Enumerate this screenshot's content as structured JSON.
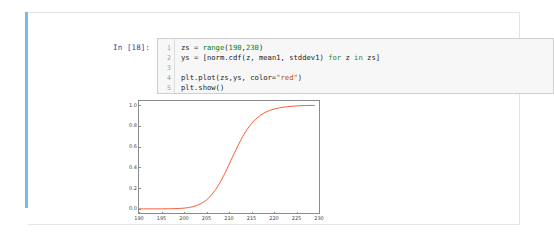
{
  "notebook": {
    "cell": {
      "prompt_label": "In [18]:",
      "line_numbers": [
        "1",
        "2",
        "3",
        "4",
        "5"
      ],
      "code_lines": [
        {
          "number": "1",
          "segments": [
            {
              "text": "zs ",
              "type": "plain"
            },
            {
              "text": "= ",
              "type": "op"
            },
            {
              "text": "range",
              "type": "fn"
            },
            {
              "text": "(",
              "type": "plain"
            },
            {
              "text": "190",
              "type": "num"
            },
            {
              "text": ",",
              "type": "plain"
            },
            {
              "text": "230",
              "type": "num"
            },
            {
              "text": ")",
              "type": "plain"
            }
          ]
        },
        {
          "number": "2",
          "segments": [
            {
              "text": "ys ",
              "type": "plain"
            },
            {
              "text": "= ",
              "type": "op"
            },
            {
              "text": "[norm.cdf(z, mean1, stddev1) ",
              "type": "plain"
            },
            {
              "text": "for ",
              "type": "kw"
            },
            {
              "text": "z ",
              "type": "plain"
            },
            {
              "text": "in ",
              "type": "kw"
            },
            {
              "text": "zs]",
              "type": "plain"
            }
          ]
        },
        {
          "number": "3",
          "segments": []
        },
        {
          "number": "4",
          "segments": [
            {
              "text": "plt.plot(zs,ys, color=",
              "type": "plain"
            },
            {
              "text": "\"red\"",
              "type": "str"
            },
            {
              "text": ")",
              "type": "plain"
            }
          ]
        },
        {
          "number": "5",
          "segments": [
            {
              "text": "plt.show()",
              "type": "plain"
            }
          ]
        }
      ],
      "code_text": "zs = range(190,230)\nys = [norm.cdf(z, mean1, stddev1) for z in zs]\n\nplt.plot(zs,ys, color=\"red\")\nplt.show()"
    }
  },
  "chart_data": {
    "type": "line",
    "title": "",
    "xlabel": "",
    "ylabel": "",
    "xlim": [
      190,
      230
    ],
    "ylim": [
      -0.04,
      1.04
    ],
    "grid": false,
    "legend": null,
    "xticks": [
      "190",
      "195",
      "200",
      "205",
      "210",
      "215",
      "220",
      "225",
      "230"
    ],
    "xtick_values": [
      190,
      195,
      200,
      205,
      210,
      215,
      220,
      225,
      230
    ],
    "yticks": [
      "1.0",
      "0.8",
      "0.6",
      "0.4",
      "0.2",
      "0.0"
    ],
    "ytick_values": [
      1.0,
      0.8,
      0.6,
      0.4,
      0.2,
      0.0
    ],
    "series": [
      {
        "name": "norm.cdf(z, mean1, stddev1)",
        "color": "#f4623a",
        "linewidth": 1.0,
        "x": [
          190,
          191,
          192,
          193,
          194,
          195,
          196,
          197,
          198,
          199,
          200,
          201,
          202,
          203,
          204,
          205,
          206,
          207,
          208,
          209,
          210,
          211,
          212,
          213,
          214,
          215,
          216,
          217,
          218,
          219,
          220,
          221,
          222,
          223,
          224,
          225,
          226,
          227,
          228,
          229
        ],
        "values": [
          0.0,
          0.0,
          0.0,
          0.0,
          0.0,
          0.0,
          0.001,
          0.001,
          0.002,
          0.004,
          0.007,
          0.012,
          0.021,
          0.035,
          0.056,
          0.086,
          0.128,
          0.184,
          0.253,
          0.335,
          0.426,
          0.52,
          0.611,
          0.694,
          0.765,
          0.823,
          0.868,
          0.903,
          0.929,
          0.948,
          0.962,
          0.972,
          0.98,
          0.985,
          0.989,
          0.992,
          0.995,
          0.996,
          0.997,
          0.998
        ]
      }
    ]
  }
}
